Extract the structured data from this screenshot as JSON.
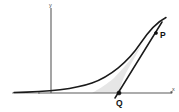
{
  "figure": {
    "background_color": "#ffffff"
  },
  "axes": {
    "y_axis": {
      "label": "y",
      "color": "#5a5a5a",
      "x_position": 51,
      "top": 8,
      "bottom": 93
    },
    "x_axis": {
      "label": "x",
      "color": "#5a5a5a",
      "y_position": 93,
      "left": 12,
      "right": 172
    },
    "origin": {
      "x": 51,
      "y": 93
    }
  },
  "curve": {
    "name": "exponential-curve",
    "color": "#1a1a1a",
    "description": "increasing convex curve asymptotic to the x-axis on the left",
    "path": "M 14 92.4 C 45 92.0, 72 90.0, 92 83.0 C 110 76.5, 128 62.0, 140 44.0 C 148 32.0, 156 22.5, 166 17.5"
  },
  "secant_line": {
    "name": "secant-line",
    "color": "#1a1a1a",
    "from": {
      "x": 115,
      "y": 98
    },
    "to": {
      "x": 162,
      "y": 22
    }
  },
  "shaded_region": {
    "name": "region-between-curve-and-line",
    "color": "#e2e2e2",
    "path": "M 119 93 L 92 93 C 92 93, 105 86, 114 78 C 124 68, 134 55, 142 44 C 138 52, 131 64, 126 73 C 122 81, 120 88, 119 93 Z"
  },
  "points": [
    {
      "id": "P",
      "label": "P",
      "marker": {
        "x": 156,
        "y": 33
      },
      "label_position": {
        "x": 160,
        "y": 38
      },
      "on": "curve"
    },
    {
      "id": "Q",
      "label": "Q",
      "marker": {
        "x": 119,
        "y": 93
      },
      "label_position": {
        "x": 117,
        "y": 106
      },
      "on": "x-axis"
    }
  ],
  "labels": {
    "y_axis_text": "y",
    "x_axis_text": "x"
  },
  "colors": {
    "ink": "#1a1a1a",
    "axis": "#5a5a5a",
    "shade": "#e2e2e2",
    "background": "#ffffff"
  }
}
